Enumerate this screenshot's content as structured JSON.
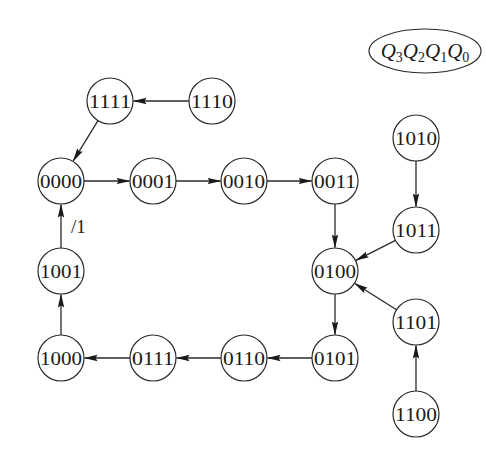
{
  "diagram": {
    "type": "state-transition",
    "legend": {
      "variables": [
        {
          "name": "Q",
          "sub": "3"
        },
        {
          "name": "Q",
          "sub": "2"
        },
        {
          "name": "Q",
          "sub": "1"
        },
        {
          "name": "Q",
          "sub": "0"
        }
      ]
    },
    "nodes": [
      {
        "id": "n1111",
        "label": "1111",
        "x": 110,
        "y": 101
      },
      {
        "id": "n1110",
        "label": "1110",
        "x": 212,
        "y": 101
      },
      {
        "id": "n0000",
        "label": "0000",
        "x": 61,
        "y": 181
      },
      {
        "id": "n0001",
        "label": "0001",
        "x": 153,
        "y": 181
      },
      {
        "id": "n0010",
        "label": "0010",
        "x": 244,
        "y": 181
      },
      {
        "id": "n0011",
        "label": "0011",
        "x": 335,
        "y": 181
      },
      {
        "id": "n1010",
        "label": "1010",
        "x": 416,
        "y": 138
      },
      {
        "id": "n1011",
        "label": "1011",
        "x": 416,
        "y": 230
      },
      {
        "id": "n0100",
        "label": "0100",
        "x": 335,
        "y": 271
      },
      {
        "id": "n1001",
        "label": "1001",
        "x": 61,
        "y": 271
      },
      {
        "id": "n1101",
        "label": "1101",
        "x": 416,
        "y": 322
      },
      {
        "id": "n1000",
        "label": "1000",
        "x": 61,
        "y": 358
      },
      {
        "id": "n0111",
        "label": "0111",
        "x": 153,
        "y": 358
      },
      {
        "id": "n0110",
        "label": "0110",
        "x": 244,
        "y": 358
      },
      {
        "id": "n0101",
        "label": "0101",
        "x": 335,
        "y": 358
      },
      {
        "id": "n1100",
        "label": "1100",
        "x": 416,
        "y": 414
      }
    ],
    "edges": [
      {
        "from": "n1110",
        "to": "n1111",
        "label": ""
      },
      {
        "from": "n1111",
        "to": "n0000",
        "label": ""
      },
      {
        "from": "n0000",
        "to": "n0001",
        "label": ""
      },
      {
        "from": "n0001",
        "to": "n0010",
        "label": ""
      },
      {
        "from": "n0010",
        "to": "n0011",
        "label": ""
      },
      {
        "from": "n0011",
        "to": "n0100",
        "label": ""
      },
      {
        "from": "n1010",
        "to": "n1011",
        "label": ""
      },
      {
        "from": "n1011",
        "to": "n0100",
        "label": ""
      },
      {
        "from": "n1101",
        "to": "n0100",
        "label": ""
      },
      {
        "from": "n1100",
        "to": "n1101",
        "label": ""
      },
      {
        "from": "n0100",
        "to": "n0101",
        "label": ""
      },
      {
        "from": "n0101",
        "to": "n0110",
        "label": ""
      },
      {
        "from": "n0110",
        "to": "n0111",
        "label": ""
      },
      {
        "from": "n0111",
        "to": "n1000",
        "label": ""
      },
      {
        "from": "n1000",
        "to": "n1001",
        "label": ""
      },
      {
        "from": "n1001",
        "to": "n0000",
        "label": "/1"
      }
    ]
  }
}
